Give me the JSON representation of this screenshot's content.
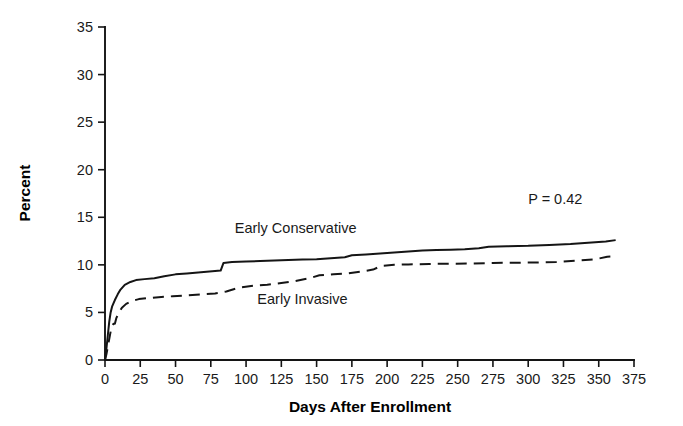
{
  "chart_data": {
    "type": "line",
    "title": "",
    "subtitle": "",
    "xlabel": "Days After Enrollment",
    "ylabel": "Percent",
    "xlim": [
      0,
      375
    ],
    "ylim": [
      0,
      35
    ],
    "xticks": [
      0,
      25,
      50,
      75,
      100,
      125,
      150,
      175,
      200,
      225,
      250,
      275,
      300,
      325,
      350,
      375
    ],
    "yticks": [
      0,
      5,
      10,
      15,
      20,
      25,
      30,
      35
    ],
    "xtick_labels": [
      "0",
      "25",
      "50",
      "75",
      "100",
      "125",
      "150",
      "175",
      "200",
      "225",
      "250",
      "275",
      "300",
      "325",
      "350",
      "375"
    ],
    "ytick_labels": [
      "0",
      "5",
      "10",
      "15",
      "20",
      "25",
      "30",
      "35"
    ],
    "grid": false,
    "legend_position": "inline-annotations",
    "annotations": [
      {
        "text": "P = 0.42",
        "x": 300,
        "y": 16.4,
        "name": "p-value-annotation"
      },
      {
        "text": "Early Conservative",
        "x": 92,
        "y": 13.3,
        "name": "series-label-conservative"
      },
      {
        "text": "Early Invasive",
        "x": 108,
        "y": 5.9,
        "name": "series-label-invasive"
      }
    ],
    "series": [
      {
        "name": "Early Conservative",
        "style": "solid",
        "points": [
          [
            0,
            0.0
          ],
          [
            1,
            1.2
          ],
          [
            2,
            2.6
          ],
          [
            3,
            4.0
          ],
          [
            4,
            5.0
          ],
          [
            5,
            5.6
          ],
          [
            7,
            6.3
          ],
          [
            9,
            6.9
          ],
          [
            11,
            7.4
          ],
          [
            14,
            7.9
          ],
          [
            18,
            8.2
          ],
          [
            22,
            8.4
          ],
          [
            28,
            8.5
          ],
          [
            35,
            8.6
          ],
          [
            42,
            8.8
          ],
          [
            50,
            9.0
          ],
          [
            58,
            9.1
          ],
          [
            66,
            9.2
          ],
          [
            74,
            9.3
          ],
          [
            82,
            9.4
          ],
          [
            84,
            10.2
          ],
          [
            90,
            10.3
          ],
          [
            100,
            10.35
          ],
          [
            110,
            10.4
          ],
          [
            120,
            10.45
          ],
          [
            130,
            10.5
          ],
          [
            140,
            10.55
          ],
          [
            150,
            10.6
          ],
          [
            160,
            10.7
          ],
          [
            170,
            10.8
          ],
          [
            175,
            11.0
          ],
          [
            185,
            11.1
          ],
          [
            195,
            11.2
          ],
          [
            205,
            11.3
          ],
          [
            215,
            11.4
          ],
          [
            225,
            11.5
          ],
          [
            235,
            11.55
          ],
          [
            245,
            11.6
          ],
          [
            255,
            11.65
          ],
          [
            265,
            11.75
          ],
          [
            272,
            11.9
          ],
          [
            285,
            11.95
          ],
          [
            300,
            12.0
          ],
          [
            315,
            12.1
          ],
          [
            330,
            12.2
          ],
          [
            345,
            12.35
          ],
          [
            355,
            12.45
          ],
          [
            362,
            12.6
          ]
        ]
      },
      {
        "name": "Early Invasive",
        "style": "dashed",
        "points": [
          [
            0,
            0.0
          ],
          [
            1,
            0.6
          ],
          [
            2,
            1.4
          ],
          [
            3,
            2.2
          ],
          [
            4,
            3.0
          ],
          [
            5,
            3.6
          ],
          [
            6,
            3.8
          ],
          [
            7,
            3.8
          ],
          [
            8,
            4.4
          ],
          [
            10,
            5.0
          ],
          [
            12,
            5.5
          ],
          [
            15,
            5.9
          ],
          [
            19,
            6.2
          ],
          [
            24,
            6.4
          ],
          [
            30,
            6.5
          ],
          [
            38,
            6.6
          ],
          [
            48,
            6.7
          ],
          [
            58,
            6.8
          ],
          [
            68,
            6.9
          ],
          [
            78,
            7.0
          ],
          [
            86,
            7.2
          ],
          [
            95,
            7.6
          ],
          [
            105,
            7.8
          ],
          [
            115,
            7.9
          ],
          [
            125,
            8.1
          ],
          [
            135,
            8.3
          ],
          [
            145,
            8.6
          ],
          [
            152,
            8.9
          ],
          [
            162,
            9.0
          ],
          [
            172,
            9.1
          ],
          [
            182,
            9.3
          ],
          [
            190,
            9.5
          ],
          [
            196,
            9.9
          ],
          [
            205,
            10.0
          ],
          [
            215,
            10.05
          ],
          [
            230,
            10.1
          ],
          [
            245,
            10.12
          ],
          [
            260,
            10.15
          ],
          [
            275,
            10.2
          ],
          [
            290,
            10.22
          ],
          [
            305,
            10.25
          ],
          [
            320,
            10.3
          ],
          [
            335,
            10.45
          ],
          [
            348,
            10.6
          ],
          [
            356,
            10.85
          ],
          [
            362,
            10.9
          ]
        ]
      }
    ]
  },
  "plot_geometry": {
    "left": 105,
    "right": 634,
    "top": 27,
    "bottom": 360
  }
}
